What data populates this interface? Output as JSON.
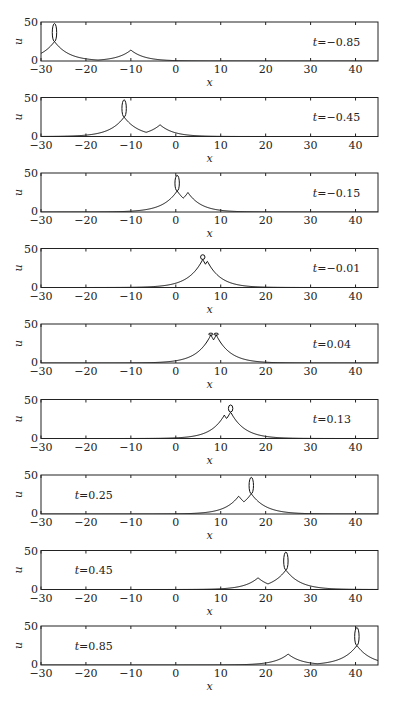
{
  "chart_data": {
    "type": "line",
    "title": "",
    "xlabel": "x",
    "ylabel": "u",
    "xlim": [
      -30,
      45
    ],
    "ylim": [
      0,
      50
    ],
    "xticks": [
      -30,
      -20,
      -10,
      0,
      10,
      20,
      30,
      40
    ],
    "yticks": [
      0,
      50
    ],
    "grid": false,
    "legend": null,
    "panels": [
      {
        "t_label": "t=−0.85",
        "t": -0.85,
        "label_pos": "right",
        "peaks": [
          {
            "x": -27.0,
            "cusp_u": 25,
            "loop_top": 48,
            "width": 3.2
          },
          {
            "x": -10.0,
            "cusp_u": 14,
            "loop_top": null,
            "width": 3.0
          }
        ]
      },
      {
        "t_label": "t=−0.45",
        "t": -0.45,
        "label_pos": "right",
        "peaks": [
          {
            "x": -11.5,
            "cusp_u": 25,
            "loop_top": 47,
            "width": 3.2
          },
          {
            "x": -3.5,
            "cusp_u": 15,
            "loop_top": null,
            "width": 3.0
          }
        ]
      },
      {
        "t_label": "t=−0.15",
        "t": -0.15,
        "label_pos": "right",
        "peaks": [
          {
            "x": 0.3,
            "cusp_u": 27,
            "loop_top": 47,
            "width": 3.2
          },
          {
            "x": 2.7,
            "cusp_u": 25,
            "loop_top": null,
            "width": 3.0
          }
        ]
      },
      {
        "t_label": "t=−0.01",
        "t": -0.01,
        "label_pos": "right",
        "peaks": [
          {
            "x": 6.0,
            "cusp_u": 36,
            "loop_top": 42,
            "width": 3.2
          },
          {
            "x": 7.0,
            "cusp_u": 34,
            "loop_top": null,
            "width": 3.0
          }
        ]
      },
      {
        "t_label": "t=0.04",
        "t": 0.04,
        "label_pos": "right",
        "peaks": [
          {
            "x": 7.8,
            "cusp_u": 36,
            "loop_top": 38,
            "width": 3.1
          },
          {
            "x": 9.0,
            "cusp_u": 36,
            "loop_top": 38,
            "width": 3.1
          }
        ]
      },
      {
        "t_label": "t=0.13",
        "t": 0.13,
        "label_pos": "right",
        "peaks": [
          {
            "x": 10.8,
            "cusp_u": 30,
            "loop_top": null,
            "width": 3.0
          },
          {
            "x": 12.2,
            "cusp_u": 34,
            "loop_top": 43,
            "width": 3.1
          }
        ]
      },
      {
        "t_label": "t=0.25",
        "t": 0.25,
        "label_pos": "left",
        "peaks": [
          {
            "x": 14.0,
            "cusp_u": 23,
            "loop_top": null,
            "width": 3.0
          },
          {
            "x": 16.8,
            "cusp_u": 26,
            "loop_top": 47,
            "width": 3.2
          }
        ]
      },
      {
        "t_label": "t=0.45",
        "t": 0.45,
        "label_pos": "left",
        "peaks": [
          {
            "x": 18.3,
            "cusp_u": 15,
            "loop_top": null,
            "width": 3.0
          },
          {
            "x": 24.5,
            "cusp_u": 25,
            "loop_top": 48,
            "width": 3.2
          }
        ]
      },
      {
        "t_label": "t=0.85",
        "t": 0.85,
        "label_pos": "left",
        "peaks": [
          {
            "x": 25.0,
            "cusp_u": 14,
            "loop_top": null,
            "width": 3.0
          },
          {
            "x": 40.3,
            "cusp_u": 25,
            "loop_top": 48,
            "width": 3.2
          }
        ]
      }
    ]
  },
  "layout": {
    "panel_left_px": 41,
    "panel_right_px": 378,
    "first_panel_top_px": 22,
    "panel_height_px": 39,
    "panel_step_px": 75.5
  }
}
